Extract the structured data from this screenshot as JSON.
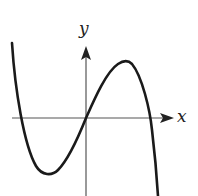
{
  "diagram": {
    "type": "function-graph",
    "axes": {
      "x_label": "x",
      "y_label": "y"
    },
    "colors": {
      "curve": "#1a1a1a",
      "axes": "#555555",
      "background": "#ffffff"
    },
    "features": {
      "passes_through_origin": true,
      "local_minimum": "left of y-axis, below x-axis",
      "local_maximum": "right of y-axis, above x-axis",
      "x_intercepts": 3
    }
  }
}
